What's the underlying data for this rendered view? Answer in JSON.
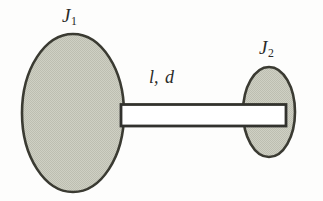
{
  "figure": {
    "kind": "mechanical-schematic",
    "background_color": "#fdfdfc",
    "outline_color": "#33332e",
    "disc_fill_color": "#c8c9bd",
    "shaft_fill_color": "#ffffff"
  },
  "labels": {
    "left_disc": {
      "text": "J",
      "subscript": "1",
      "name": "left-inertia-label"
    },
    "right_disc": {
      "text": "J",
      "subscript": "2",
      "name": "right-inertia-label"
    },
    "shaft": {
      "text_l": "l",
      "separator": ",",
      "text_d": "d",
      "name": "shaft-length-diameter-label"
    }
  },
  "geometry": {
    "left_disc": {
      "cx": 73,
      "cy": 113,
      "rx": 51,
      "ry": 79
    },
    "right_disc": {
      "cx": 269,
      "cy": 112,
      "rx": 26,
      "ry": 45
    },
    "shaft": {
      "x": 122,
      "y": 105,
      "width": 164,
      "height": 21
    }
  }
}
